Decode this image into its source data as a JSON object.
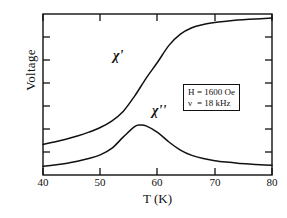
{
  "chart_data": {
    "type": "line",
    "title": "",
    "subtitle": "",
    "xlabel": "T (K)",
    "ylabel": "Voltage",
    "xlim": [
      40,
      80
    ],
    "ylim": [
      0,
      1
    ],
    "xticks": [
      40,
      50,
      60,
      70,
      80
    ],
    "xtick_labels": [
      "40",
      "50",
      "60",
      "70",
      "80"
    ],
    "ytick_labels": [],
    "yticks_count": 7,
    "grid": false,
    "legend": "none",
    "axis_color": "#111111",
    "curve_color": "#111111",
    "series": [
      {
        "name": "chi-prime",
        "label": "χ'",
        "description": "real part of AC susceptibility, sigmoidal rise saturating above 65 K",
        "x": [
          40,
          42,
          44,
          46,
          48,
          50,
          52,
          54,
          56,
          58,
          60,
          62,
          64,
          66,
          68,
          70,
          72,
          74,
          76,
          78,
          80
        ],
        "y": [
          0.19,
          0.205,
          0.222,
          0.242,
          0.266,
          0.295,
          0.335,
          0.395,
          0.49,
          0.6,
          0.7,
          0.805,
          0.875,
          0.915,
          0.935,
          0.947,
          0.955,
          0.962,
          0.967,
          0.971,
          0.975
        ]
      },
      {
        "name": "chi-double-prime",
        "label": "χ''",
        "description": "imaginary part of AC susceptibility, peak near 57 K then decay",
        "x": [
          40,
          42,
          44,
          46,
          48,
          50,
          52,
          54,
          56,
          57,
          58,
          60,
          62,
          64,
          66,
          68,
          70,
          72,
          74,
          76,
          78,
          80
        ],
        "y": [
          0.055,
          0.062,
          0.072,
          0.085,
          0.102,
          0.125,
          0.165,
          0.235,
          0.3,
          0.31,
          0.305,
          0.265,
          0.205,
          0.155,
          0.122,
          0.102,
          0.089,
          0.08,
          0.073,
          0.068,
          0.064,
          0.06
        ]
      }
    ],
    "annotations": [
      {
        "name": "conditions-box",
        "lines": [
          {
            "symbol": "H",
            "equals": "=",
            "value": "1600 Oe"
          },
          {
            "symbol": "ν",
            "equals": "=",
            "value": "18 kHz"
          }
        ]
      }
    ]
  },
  "curve_labels": {
    "chi_prime": "χ'",
    "chi_double_prime": "χ''"
  }
}
